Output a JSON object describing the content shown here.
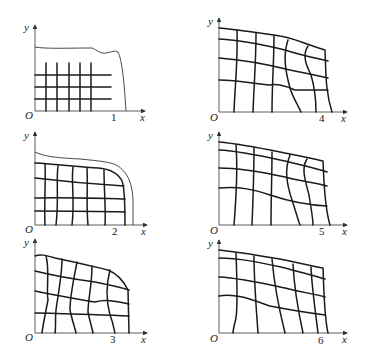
{
  "figure": {
    "axis_labels": {
      "x": "x",
      "y": "y",
      "origin": "O"
    },
    "panels": [
      {
        "id": 1,
        "label": "1"
      },
      {
        "id": 2,
        "label": "2"
      },
      {
        "id": 3,
        "label": "3"
      },
      {
        "id": 4,
        "label": "4"
      },
      {
        "id": 5,
        "label": "5"
      },
      {
        "id": 6,
        "label": "6"
      }
    ]
  }
}
